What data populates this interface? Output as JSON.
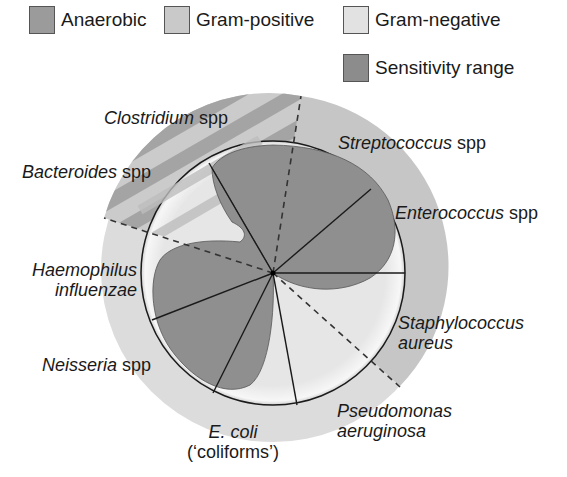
{
  "legend": {
    "items": [
      {
        "label": "Anaerobic",
        "color": "#9b9b9b"
      },
      {
        "label": "Gram-positive",
        "color": "#c9c9c9"
      },
      {
        "label": "Gram-negative",
        "color": "#e2e2e2"
      },
      {
        "label": "Sensitivity range",
        "color": "#8c8c8c"
      }
    ]
  },
  "diagram": {
    "groups": [
      {
        "name": "Anaerobic",
        "organisms": [
          "Clostridium spp",
          "Bacteroides spp"
        ]
      },
      {
        "name": "Gram-positive",
        "organisms": [
          "Streptococcus spp",
          "Enterococcus spp",
          "Staphylococcus aureus"
        ]
      },
      {
        "name": "Gram-negative",
        "organisms": [
          "Pseudomonas aeruginosa",
          "E. coli ('coliforms')",
          "Neisseria spp",
          "Haemophilus influenzae"
        ]
      }
    ],
    "labels": {
      "clostridium": {
        "italic": "Clostridium",
        "plain": " spp"
      },
      "streptococcus": {
        "italic": "Streptococcus",
        "plain": " spp"
      },
      "bacteroides": {
        "italic": "Bacteroides",
        "plain": " spp"
      },
      "enterococcus": {
        "italic": "Enterococcus",
        "plain": " spp"
      },
      "haemophilus": {
        "line1": "Haemophilus",
        "line2": "influenzae"
      },
      "staphylococcus": {
        "line1": "Staphylococcus",
        "line2": "aureus"
      },
      "neisseria": {
        "italic": "Neisseria",
        "plain": " spp"
      },
      "pseudomonas": {
        "line1": "Pseudomonas",
        "line2": "aeruginosa"
      },
      "ecoli": {
        "line1": "E. coli",
        "line2": "(‘coliforms’)"
      }
    },
    "colors": {
      "outer_ring_gram_negative": "#dcdcdc",
      "outer_ring_gram_positive": "#c4c4c4",
      "anaerobic_stripe": "#a8a8a8",
      "inner_disc": "#e8e8e8",
      "sensitivity": "#8f8f8f",
      "lines": "#1a1a1a"
    }
  }
}
